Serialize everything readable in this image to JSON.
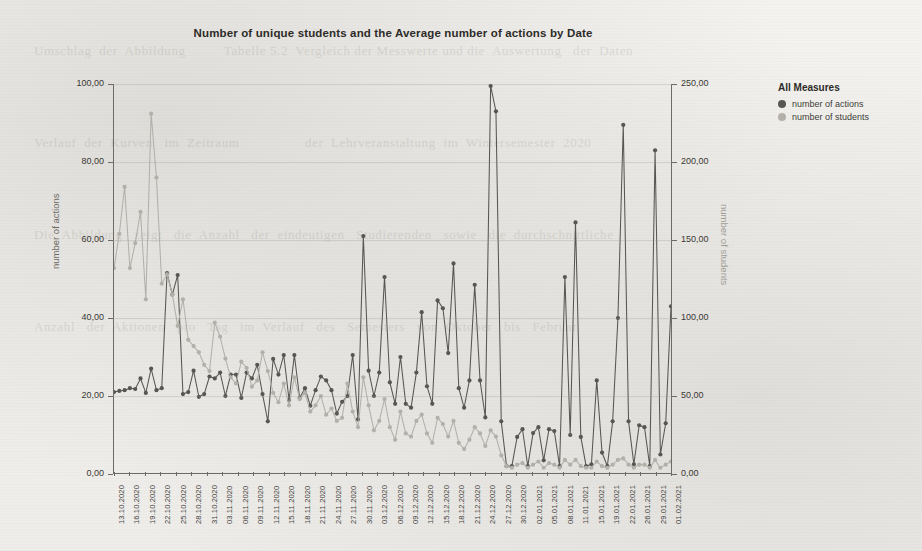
{
  "page": {
    "background_color": "#f2f1ee",
    "ghost_text": "Umschlag  der  Abbildung          Tabelle 5.2  Vergleich der Messwerte und die  Auswertung   der  Daten\n\nVerlauf  der  Kurven   im  Zeitraum                 der  Lehrveranstaltung  im  Wintersemester  2020\n\nDie  Abbildung   zeigt   die  Anzahl   der  eindeutigen   Studierenden   sowie   die  durchschnittliche\n\nAnzahl   der  Aktionen   pro   Tag   im  Verlauf   des   Semesters   von  Oktober   bis   Februar"
  },
  "chart_data": {
    "type": "line",
    "title": "Number of unique students and the Average number of actions by Date",
    "xlabel": "",
    "ylabel": "number of actions",
    "y2label": "number of students",
    "ylim": [
      0,
      100
    ],
    "y2lim": [
      0,
      250
    ],
    "yticks": [
      "0,00",
      "20,00",
      "40,00",
      "60,00",
      "80,00",
      "100,00"
    ],
    "ytick_values": [
      0,
      20,
      40,
      60,
      80,
      100
    ],
    "y2ticks": [
      "0,00",
      "50,00",
      "100,00",
      "150,00",
      "200,00",
      "250,00"
    ],
    "y2tick_values": [
      0,
      50,
      100,
      150,
      200,
      250
    ],
    "grid": true,
    "legend_position": "right",
    "legend_title": "All Measures",
    "x_tick_labels": [
      "13.10.2020",
      "16.10.2020",
      "19.10.2020",
      "22.10.2020",
      "25.10.2020",
      "28.10.2020",
      "31.10.2020",
      "03.11.2020",
      "06.11.2020",
      "09.11.2020",
      "12.11.2020",
      "15.11.2020",
      "18.11.2020",
      "21.11.2020",
      "24.11.2020",
      "27.11.2020",
      "30.11.2020",
      "03.12.2020",
      "06.12.2020",
      "09.12.2020",
      "12.12.2020",
      "15.12.2020",
      "18.12.2020",
      "21.12.2020",
      "24.12.2020",
      "27.12.2020",
      "30.12.2020",
      "02.01.2021",
      "05.01.2021",
      "08.01.2021",
      "11.01.2021",
      "15.01.2021",
      "19.01.2021",
      "22.01.2021",
      "26.01.2021",
      "29.01.2021",
      "01.02.2021"
    ],
    "series": [
      {
        "name": "number of actions",
        "color": "#585652",
        "axis": "left",
        "values": [
          21.0,
          21.3,
          21.5,
          22.0,
          21.8,
          24.5,
          20.8,
          27.0,
          21.5,
          22.0,
          51.5,
          46.0,
          51.0,
          20.5,
          21.0,
          26.5,
          19.8,
          20.5,
          25.0,
          24.5,
          26.0,
          20.0,
          25.5,
          25.5,
          19.5,
          26.0,
          24.5,
          28.0,
          20.5,
          13.5,
          29.5,
          25.5,
          30.5,
          19.0,
          30.5,
          19.5,
          22.0,
          17.5,
          21.5,
          25.0,
          24.0,
          21.5,
          15.5,
          18.5,
          20.0,
          30.5,
          14.0,
          61.0,
          26.5,
          20.0,
          26.0,
          50.5,
          23.5,
          18.0,
          30.0,
          18.0,
          17.0,
          26.0,
          41.5,
          22.5,
          18.0,
          44.5,
          42.5,
          31.0,
          54.0,
          22.0,
          17.0,
          24.0,
          48.5,
          24.0,
          14.5,
          99.5,
          93.0,
          13.5,
          2.0,
          2.0,
          9.5,
          11.5,
          2.0,
          10.5,
          12.0,
          3.5,
          11.5,
          11.0,
          2.0,
          50.5,
          10.0,
          64.5,
          9.5,
          2.0,
          2.5,
          24.0,
          5.5,
          2.0,
          13.5,
          40.0,
          89.5,
          13.5,
          2.5,
          12.5,
          12.0,
          2.0,
          83.0,
          5.0,
          13.0,
          43.0
        ]
      },
      {
        "name": "number of students",
        "color": "#b3b0aa",
        "axis": "right",
        "values": [
          132,
          154,
          184,
          132,
          148,
          168,
          112,
          231,
          190,
          122,
          128,
          115,
          95,
          112,
          86,
          82,
          78,
          70,
          66,
          97,
          88,
          74,
          62,
          58,
          72,
          68,
          56,
          60,
          78,
          66,
          52,
          46,
          58,
          44,
          62,
          48,
          52,
          40,
          44,
          50,
          38,
          42,
          34,
          36,
          58,
          40,
          30,
          62,
          44,
          28,
          34,
          48,
          30,
          22,
          40,
          26,
          24,
          34,
          38,
          26,
          20,
          36,
          32,
          24,
          34,
          20,
          16,
          22,
          30,
          26,
          18,
          28,
          24,
          12,
          5,
          4,
          6,
          7,
          4,
          6,
          8,
          4,
          7,
          6,
          4,
          9,
          6,
          9,
          5,
          4,
          4,
          8,
          5,
          4,
          6,
          9,
          10,
          6,
          4,
          6,
          6,
          4,
          9,
          4,
          6,
          8
        ]
      }
    ]
  },
  "legend": {
    "title": "All Measures",
    "items": [
      {
        "label": "number of actions",
        "color": "#585652"
      },
      {
        "label": "number of students",
        "color": "#b3b0aa"
      }
    ]
  }
}
